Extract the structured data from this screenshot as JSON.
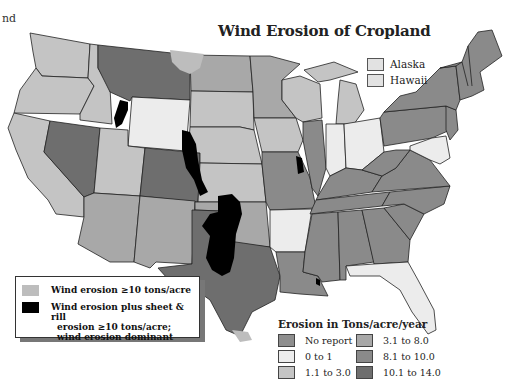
{
  "fragment_text": "nd",
  "title": "Wind Erosion of Cropland",
  "colors": {
    "no_report": "#8e8e8e",
    "c0_1": "#ececec",
    "c1_3": "#c4c4c4",
    "c3_8": "#a8a8a8",
    "c8_10": "#8a8a8a",
    "c10_14": "#6e6e6e",
    "wind_ge10": "#bdbdbd",
    "wind_sheet_rill": "#000000"
  },
  "inset_states": [
    {
      "label": "Alaska",
      "color": "#e2e2e2"
    },
    {
      "label": "Hawaii",
      "color": "#e2e2e2"
    }
  ],
  "overlay_legend": [
    {
      "label": "Wind erosion ≥10 tons/acre",
      "color": "#bdbdbd"
    },
    {
      "label": "Wind erosion plus sheet & rill erosion ≥10 tons/acre; wind erosion dominant",
      "lines": [
        "Wind erosion plus sheet & rill",
        "erosion ≥10 tons/acre;",
        "wind erosion dominant"
      ],
      "color": "#000000"
    }
  ],
  "class_legend": {
    "title": "Erosion in Tons/acre/year",
    "items": [
      {
        "label": "No report",
        "color": "#8e8e8e"
      },
      {
        "label": "3.1 to 8.0",
        "color": "#a8a8a8"
      },
      {
        "label": "0 to 1",
        "color": "#ececec"
      },
      {
        "label": "8.1 to 10.0",
        "color": "#8a8a8a"
      },
      {
        "label": "1.1 to 3.0",
        "color": "#c4c4c4"
      },
      {
        "label": "10.1 to 14.0",
        "color": "#6e6e6e"
      }
    ]
  },
  "states": {
    "Washington": "1.1 to 3.0",
    "Oregon": "1.1 to 3.0",
    "California": "1.1 to 3.0",
    "Idaho": "1.1 to 3.0",
    "Nevada": "10.1 to 14.0",
    "Montana": "10.1 to 14.0",
    "Wyoming": "0 to 1",
    "Utah": "1.1 to 3.0",
    "Colorado": "10.1 to 14.0",
    "Arizona": "3.1 to 8.0",
    "New Mexico": "3.1 to 8.0",
    "North Dakota": "3.1 to 8.0",
    "South Dakota": "1.1 to 3.0",
    "Nebraska": "1.1 to 3.0",
    "Kansas": "1.1 to 3.0",
    "Oklahoma": "3.1 to 8.0",
    "Texas": "10.1 to 14.0",
    "Minnesota": "3.1 to 8.0",
    "Iowa": "1.1 to 3.0",
    "Missouri": "8.1 to 10.0",
    "Arkansas": "0 to 1",
    "Louisiana": "8.1 to 10.0",
    "Wisconsin": "1.1 to 3.0",
    "Illinois": "8.1 to 10.0",
    "Michigan": "1.1 to 3.0",
    "Indiana": "0 to 1",
    "Ohio": "0 to 1",
    "Kentucky": "8.1 to 10.0",
    "Tennessee": "8.1 to 10.0",
    "Mississippi": "8.1 to 10.0",
    "Alabama": "8.1 to 10.0",
    "Georgia": "8.1 to 10.0",
    "Florida": "0 to 1",
    "South Carolina": "8.1 to 10.0",
    "North Carolina": "8.1 to 10.0",
    "Virginia": "8.1 to 10.0",
    "West Virginia": "8.1 to 10.0",
    "Pennsylvania": "8.1 to 10.0",
    "New York": "8.1 to 10.0",
    "New Jersey": "8.1 to 10.0",
    "Maryland": "0 to 1",
    "Delaware": "0 to 1",
    "New England": "8.1 to 10.0"
  }
}
